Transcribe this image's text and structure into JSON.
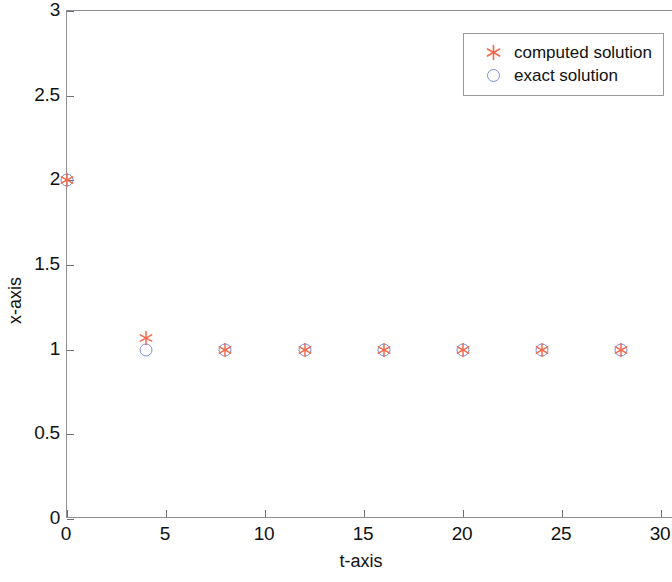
{
  "chart_data": {
    "type": "scatter",
    "title": "",
    "xlabel": "t-axis",
    "ylabel": "x-axis",
    "xlim": [
      0,
      30
    ],
    "ylim": [
      0,
      3
    ],
    "xticks": [
      "0",
      "5",
      "10",
      "15",
      "20",
      "25",
      "30"
    ],
    "xtick_values": [
      0,
      5,
      10,
      15,
      20,
      25,
      30
    ],
    "yticks": [
      "0",
      "0.5",
      "1",
      "1.5",
      "2",
      "2.5",
      "3"
    ],
    "ytick_values": [
      0,
      0.5,
      1,
      1.5,
      2,
      2.5,
      3
    ],
    "grid": false,
    "legend_position": "top-right",
    "series": [
      {
        "name": "computed solution",
        "marker": "asterisk",
        "color": "#f4694a",
        "x": [
          0,
          4,
          8,
          12,
          16,
          20,
          24,
          28
        ],
        "y": [
          2.0,
          1.07,
          1.0,
          1.0,
          1.0,
          1.0,
          1.0,
          1.0
        ]
      },
      {
        "name": "exact solution",
        "marker": "circle-open",
        "color": "#7b8fd4",
        "x": [
          0,
          4,
          8,
          12,
          16,
          20,
          24,
          28
        ],
        "y": [
          2.0,
          1.0,
          1.0,
          1.0,
          1.0,
          1.0,
          1.0,
          1.0
        ]
      }
    ]
  },
  "legend": {
    "entries": [
      {
        "label": "computed solution",
        "marker": "asterisk-icon"
      },
      {
        "label": "exact solution",
        "marker": "circle-icon"
      }
    ]
  },
  "colors": {
    "computed": "#f4694a",
    "exact": "#7b8fd4",
    "axis": "#8e8e93",
    "text": "#111111",
    "background": "#ffffff"
  }
}
